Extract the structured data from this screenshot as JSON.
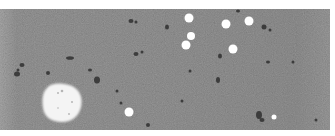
{
  "image": {
    "description": "Grayscale micrograph: noisy gray field with scattered white circular particles, one large white irregular blob and small dark debris specks",
    "width": 335,
    "height": 136,
    "frame": {
      "border_color": "#ffffff",
      "field": {
        "x": 0,
        "y": 9,
        "width": 330,
        "height": 121
      }
    },
    "colors": {
      "field_base": "#9a9a9a",
      "field_light": "#a8a8a8",
      "field_dark": "#8a8a8a",
      "particle": "#ffffff",
      "blob": "#f4f4f4",
      "debris": "#2a2a2a"
    },
    "white_particles": [
      {
        "cx": 189,
        "cy": 18,
        "r": 4.5
      },
      {
        "cx": 191,
        "cy": 36,
        "r": 4
      },
      {
        "cx": 186,
        "cy": 45,
        "r": 4.5
      },
      {
        "cx": 226,
        "cy": 24,
        "r": 4.5
      },
      {
        "cx": 249,
        "cy": 21,
        "r": 4.5
      },
      {
        "cx": 233,
        "cy": 49,
        "r": 4.5
      },
      {
        "cx": 129,
        "cy": 112,
        "r": 4.5
      },
      {
        "cx": 274,
        "cy": 117,
        "r": 2.5
      }
    ],
    "large_blob": {
      "path": "M47,88 C52,82 64,83 72,86 C80,90 83,98 81,107 C79,116 72,122 62,122 C52,122 44,117 43,108 C42,100 42,93 47,88 Z"
    },
    "debris": [
      {
        "cx": 131,
        "cy": 21,
        "rx": 2.5,
        "ry": 2
      },
      {
        "cx": 136,
        "cy": 22,
        "rx": 1.5,
        "ry": 1.5
      },
      {
        "cx": 167,
        "cy": 27,
        "rx": 2,
        "ry": 2.5
      },
      {
        "cx": 136,
        "cy": 54,
        "rx": 2.5,
        "ry": 2
      },
      {
        "cx": 142,
        "cy": 52,
        "rx": 1.5,
        "ry": 1.5
      },
      {
        "cx": 70,
        "cy": 58,
        "rx": 4,
        "ry": 1.8
      },
      {
        "cx": 22,
        "cy": 65,
        "rx": 2.5,
        "ry": 2
      },
      {
        "cx": 17,
        "cy": 74,
        "rx": 3,
        "ry": 2.5
      },
      {
        "cx": 97,
        "cy": 80,
        "rx": 3,
        "ry": 3.5
      },
      {
        "cx": 90,
        "cy": 70,
        "rx": 2,
        "ry": 1.5
      },
      {
        "cx": 117,
        "cy": 91,
        "rx": 1.5,
        "ry": 1.5
      },
      {
        "cx": 121,
        "cy": 103,
        "rx": 1.5,
        "ry": 1.5
      },
      {
        "cx": 48,
        "cy": 73,
        "rx": 2,
        "ry": 2
      },
      {
        "cx": 18,
        "cy": 70,
        "rx": 1.5,
        "ry": 1.5
      },
      {
        "cx": 264,
        "cy": 27,
        "rx": 2.5,
        "ry": 2.5
      },
      {
        "cx": 270,
        "cy": 30,
        "rx": 1.5,
        "ry": 1.5
      },
      {
        "cx": 238,
        "cy": 11,
        "rx": 2,
        "ry": 1.5
      },
      {
        "cx": 220,
        "cy": 56,
        "rx": 2,
        "ry": 2.5
      },
      {
        "cx": 268,
        "cy": 62,
        "rx": 2,
        "ry": 1.5
      },
      {
        "cx": 293,
        "cy": 62,
        "rx": 1.5,
        "ry": 1.5
      },
      {
        "cx": 218,
        "cy": 80,
        "rx": 2,
        "ry": 3
      },
      {
        "cx": 190,
        "cy": 71,
        "rx": 1.5,
        "ry": 1.5
      },
      {
        "cx": 259,
        "cy": 115,
        "rx": 3,
        "ry": 4
      },
      {
        "cx": 262,
        "cy": 120,
        "rx": 2.5,
        "ry": 2
      },
      {
        "cx": 148,
        "cy": 125,
        "rx": 2,
        "ry": 2
      },
      {
        "cx": 182,
        "cy": 101,
        "rx": 1.5,
        "ry": 1.5
      },
      {
        "cx": 316,
        "cy": 120,
        "rx": 1.5,
        "ry": 1.5
      }
    ]
  }
}
